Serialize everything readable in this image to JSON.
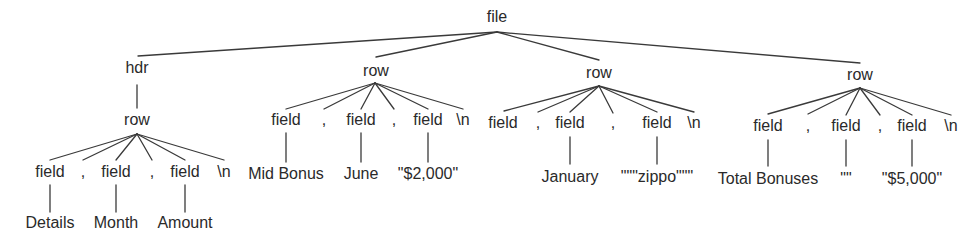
{
  "diagram": {
    "type": "parse-tree",
    "root": {
      "label": "file",
      "children": [
        {
          "label": "hdr",
          "children": [
            {
              "label": "row",
              "children": [
                {
                  "label": "field",
                  "children": [
                    {
                      "label": "Details"
                    }
                  ]
                },
                {
                  "label": ","
                },
                {
                  "label": "field",
                  "children": [
                    {
                      "label": "Month"
                    }
                  ]
                },
                {
                  "label": ","
                },
                {
                  "label": "field",
                  "children": [
                    {
                      "label": "Amount"
                    }
                  ]
                },
                {
                  "label": "\\n"
                }
              ]
            }
          ]
        },
        {
          "label": "row",
          "children": [
            {
              "label": "field",
              "children": [
                {
                  "label": "Mid Bonus"
                }
              ]
            },
            {
              "label": ","
            },
            {
              "label": "field",
              "children": [
                {
                  "label": "June"
                }
              ]
            },
            {
              "label": ","
            },
            {
              "label": "field",
              "children": [
                {
                  "label": "\"$2,000\""
                }
              ]
            },
            {
              "label": "\\n"
            }
          ]
        },
        {
          "label": "row",
          "children": [
            {
              "label": "field"
            },
            {
              "label": ","
            },
            {
              "label": "field",
              "children": [
                {
                  "label": "January"
                }
              ]
            },
            {
              "label": ","
            },
            {
              "label": "field",
              "children": [
                {
                  "label": "\"\"\"zippo\"\"\""
                }
              ]
            },
            {
              "label": "\\n"
            }
          ]
        },
        {
          "label": "row",
          "children": [
            {
              "label": "field",
              "children": [
                {
                  "label": "Total Bonuses"
                }
              ]
            },
            {
              "label": ","
            },
            {
              "label": "field",
              "children": [
                {
                  "label": "\"\""
                }
              ]
            },
            {
              "label": ","
            },
            {
              "label": "field",
              "children": [
                {
                  "label": "\"$5,000\""
                }
              ]
            },
            {
              "label": "\\n"
            }
          ]
        }
      ]
    }
  },
  "labels": {
    "file": "file",
    "hdr": "hdr",
    "row": "row",
    "field": "field",
    "comma": ",",
    "newline": "\\n",
    "hdr_values": [
      "Details",
      "Month",
      "Amount"
    ],
    "row1_values": [
      "Mid Bonus",
      "June",
      "\"$2,000\""
    ],
    "row2_values": [
      "January",
      "\"\"\"zippo\"\"\""
    ],
    "row3_values": [
      "Total Bonuses",
      "\"\"",
      "\"$5,000\""
    ]
  }
}
